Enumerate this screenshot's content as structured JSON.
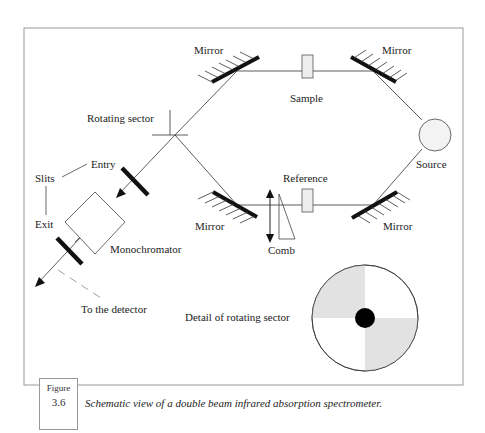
{
  "figure": {
    "label_word": "Figure",
    "label_number": "3.6",
    "caption": "Schematic view of a double beam infrared absorption spectrometer."
  },
  "diagram": {
    "labels": {
      "mirror_top_left": "Mirror",
      "mirror_top_right": "Mirror",
      "mirror_bottom_left": "Mirror",
      "mirror_bottom_right": "Mirror",
      "sample": "Sample",
      "reference": "Reference",
      "source": "Source",
      "rotating_sector": "Rotating sector",
      "entry": "Entry",
      "slits": "Slits",
      "exit": "Exit",
      "monochromator": "Monochromator",
      "comb": "Comb",
      "to_detector": "To the detector",
      "detail_rotating_sector": "Detail of rotating sector"
    },
    "colors": {
      "line": "#333333",
      "mirror": "#111111",
      "sector_shade": "#e2e2e2",
      "frame": "#999999",
      "hub": "#000000"
    }
  }
}
